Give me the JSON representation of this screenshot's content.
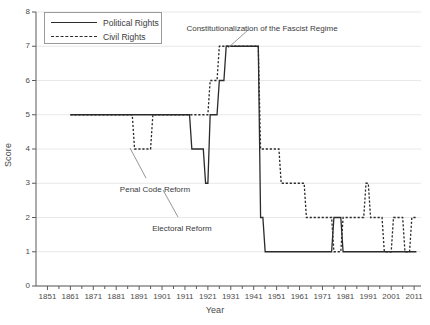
{
  "chart_data": {
    "type": "line",
    "title": "",
    "xlabel": "Year",
    "ylabel": "Score",
    "xlim": [
      1846,
      2014
    ],
    "ylim": [
      0,
      8
    ],
    "grid": true,
    "legend_position": "top-left",
    "xticks": [
      1851,
      1861,
      1871,
      1881,
      1891,
      1901,
      1911,
      1921,
      1931,
      1941,
      1951,
      1961,
      1971,
      1981,
      1991,
      2001,
      2011
    ],
    "minor_xtick_step": 5,
    "yticks": [
      0,
      1,
      2,
      3,
      4,
      5,
      6,
      7,
      8
    ],
    "series": [
      {
        "name": "Political Rights",
        "style": "solid",
        "color": "#2b2b2b",
        "points": [
          [
            1861,
            5
          ],
          [
            1913,
            5
          ],
          [
            1914,
            4
          ],
          [
            1919,
            4
          ],
          [
            1920,
            3
          ],
          [
            1921,
            3
          ],
          [
            1922,
            5
          ],
          [
            1925,
            5
          ],
          [
            1926,
            6
          ],
          [
            1928,
            6
          ],
          [
            1929,
            7
          ],
          [
            1943,
            7
          ],
          [
            1944,
            2
          ],
          [
            1945,
            2
          ],
          [
            1946,
            1
          ],
          [
            1975,
            1
          ],
          [
            1976,
            2
          ],
          [
            1979,
            2
          ],
          [
            1980,
            1
          ],
          [
            2012,
            1
          ]
        ]
      },
      {
        "name": "Civil Rights",
        "style": "dashed",
        "color": "#2b2b2b",
        "points": [
          [
            1861,
            5
          ],
          [
            1888,
            5
          ],
          [
            1889,
            4
          ],
          [
            1896,
            4
          ],
          [
            1897,
            5
          ],
          [
            1913,
            5
          ],
          [
            1921,
            5
          ],
          [
            1922,
            6
          ],
          [
            1925,
            6
          ],
          [
            1926,
            7
          ],
          [
            1943,
            7
          ],
          [
            1944,
            4
          ],
          [
            1952,
            4
          ],
          [
            1953,
            3
          ],
          [
            1963,
            3
          ],
          [
            1964,
            2
          ],
          [
            1975,
            2
          ],
          [
            1976,
            1
          ],
          [
            1979,
            1
          ],
          [
            1980,
            2
          ],
          [
            1989,
            2
          ],
          [
            1990,
            3
          ],
          [
            1991,
            3
          ],
          [
            1992,
            2
          ],
          [
            1997,
            2
          ],
          [
            1998,
            1
          ],
          [
            2001,
            1
          ],
          [
            2002,
            2
          ],
          [
            2006,
            2
          ],
          [
            2007,
            1
          ],
          [
            2009,
            1
          ],
          [
            2010,
            2
          ],
          [
            2012,
            2
          ]
        ]
      }
    ],
    "annotations": [
      {
        "text": "Constitutionalization of the Fascist Regime",
        "label_x": 262,
        "label_y": 24,
        "line": [
          228,
          48,
          248,
          30
        ]
      },
      {
        "text": "Penal Code Reform",
        "label_x": 155,
        "label_y": 185,
        "line": [
          130,
          148,
          146,
          178
        ]
      },
      {
        "text": "Electoral Reform",
        "label_x": 182,
        "label_y": 224,
        "line": [
          163,
          190,
          178,
          217
        ]
      }
    ]
  },
  "legend": {
    "items": [
      {
        "label": "Political Rights",
        "style": "solid"
      },
      {
        "label": "Civil Rights",
        "style": "dashed"
      }
    ]
  }
}
